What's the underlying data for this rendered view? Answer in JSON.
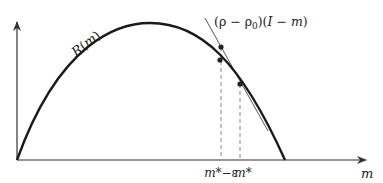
{
  "diagram": {
    "curve_label": "R(m)",
    "curve_label_parts": {
      "name": "R",
      "open": "(",
      "var": "m",
      "close": ")"
    },
    "tangent_label": "(ρ − ρ0)(I − m)",
    "tangent_label_parts": {
      "p1": "(ρ − ρ",
      "sub": "0",
      "p2": ")(",
      "I": "I",
      "minus": " − ",
      "m": "m",
      "p3": ")"
    },
    "x_axis_label": "m",
    "tick_labels": [
      {
        "id": "m-star-minus-eps",
        "text": "m*−ε",
        "parts": {
          "m": "m",
          "rest": "*−ε"
        }
      },
      {
        "id": "m-star",
        "text": "m*",
        "parts": {
          "m": "m",
          "rest": "*"
        }
      }
    ],
    "colors": {
      "curve": "#1a1a1a",
      "axis": "#333333",
      "tangent": "#444444",
      "dashed": "#888888"
    }
  }
}
